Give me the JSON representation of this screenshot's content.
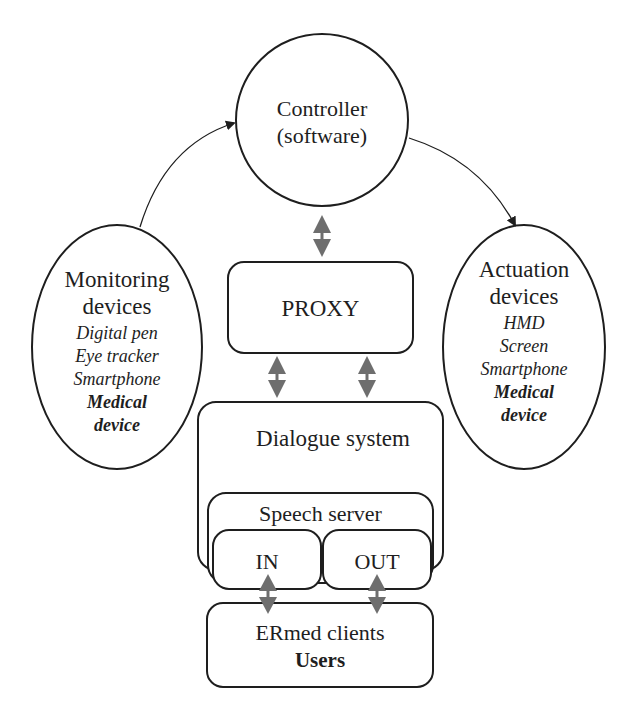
{
  "diagram": {
    "controller": {
      "line1": "Controller",
      "line2": "(software)"
    },
    "monitoring": {
      "title1": "Monitoring",
      "title2": "devices",
      "items": [
        "Digital pen",
        "Eye tracker",
        "Smartphone"
      ],
      "bold_item1": "Medical",
      "bold_item2": "device"
    },
    "actuation": {
      "title1": "Actuation",
      "title2": "devices",
      "items": [
        "HMD",
        "Screen",
        "Smartphone"
      ],
      "bold_item1": "Medical",
      "bold_item2": "device"
    },
    "proxy": {
      "label": "PROXY"
    },
    "dialogue": {
      "label": "Dialogue system"
    },
    "speech_server": {
      "label": "Speech server"
    },
    "in_box": {
      "label": "IN"
    },
    "out_box": {
      "label": "OUT"
    },
    "clients": {
      "line1": "ERmed clients",
      "line2": "Users"
    },
    "colors": {
      "stroke": "#1e1e1e",
      "bidirectional_arrow": "#6e6e6e"
    }
  }
}
